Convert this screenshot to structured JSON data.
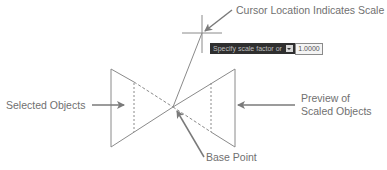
{
  "labels": {
    "cursor_location": "Cursor Location Indicates Scale",
    "selected_objects": "Selected Objects",
    "preview_line1": "Preview of",
    "preview_line2": "Scaled Objects",
    "base_point": "Base Point"
  },
  "prompt": {
    "text": "Specify scale factor or",
    "dropdown_icon": "down-arrow-icon",
    "input_value": "1.0000"
  },
  "caption_partial": "… (clipped caption text)",
  "colors": {
    "line": "#8a8a8a",
    "arrow": "#7a7a7a",
    "tooltip_bg": "#2f2f2f"
  }
}
